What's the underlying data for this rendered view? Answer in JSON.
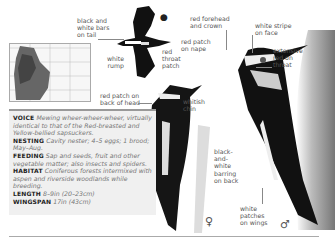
{
  "labels": {
    "tail_bars": "black and\nwhite bars\non tail",
    "white_rump": "white\nrump",
    "red_throat_patch": "red\nthroat\npatch",
    "red_forehead": "red forehead\nand crown",
    "white_stripe_face": "white stripe\non face",
    "red_patch_nape": "red patch\non nape",
    "extensive_red_throat": "extensive\nred on\nthroat",
    "red_patch_back_head": "red patch on\nback of head",
    "whitish_chin": "whitish\nchin",
    "barring_back": "black-\nand-\nwhite\nbarring\non back",
    "white_patches_wings": "white\npatches\non wings"
  },
  "symbols": {
    "female": "♀",
    "male": "♂",
    "habitat_icon": "tree-icon"
  },
  "info": {
    "voice_label": "VOICE",
    "voice_text": "Mewing wheer-wheer-wheer, virtually identical to that of the Red-breasted and Yellow-bellied sapsuckers.",
    "nesting_label": "NESTING",
    "nesting_text": "Cavity nester; 4–5 eggs; 1 brood; May–Aug.",
    "feeding_label": "FEEDING",
    "feeding_text": "Sap and seeds, fruit and other vegetable matter; also insects and spiders.",
    "habitat_label": "HABITAT",
    "habitat_text": "Coniferous forests intermixed with aspen and riverside woodlands while breeding.",
    "length_label": "LENGTH",
    "length_text": "8–9in (20–23cm)",
    "wingspan_label": "WINGSPAN",
    "wingspan_text": "17in (43cm)"
  },
  "colors": {
    "infobox_bg": "#f0f0f0",
    "rule": "#999999"
  }
}
